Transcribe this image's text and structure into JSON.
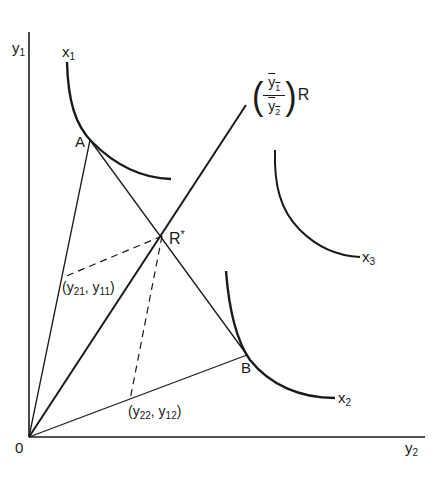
{
  "diagram": {
    "axes": {
      "y_label": "y",
      "y_sub": "1",
      "x_label": "y",
      "x_sub": "2",
      "origin_label": "0"
    },
    "curves": [
      {
        "label": "x",
        "sub": "1"
      },
      {
        "label": "x",
        "sub": "2"
      },
      {
        "label": "x",
        "sub": "3"
      }
    ],
    "points": {
      "A": "A",
      "B": "B",
      "R_star": "R",
      "R_star_sup": "*"
    },
    "ray_label": {
      "numerator": "y′1",
      "num_text": "y",
      "num_sub": "1",
      "den_text": "y",
      "den_sub": "2",
      "suffix": "R",
      "open_paren": "(",
      "close_paren": ")"
    },
    "coords": {
      "left": {
        "open": "(",
        "a": "y",
        "a_sub": "21",
        "sep": ", ",
        "b": "y",
        "b_sub": "11",
        "close": ")"
      },
      "bottom": {
        "open": "(",
        "a": "y",
        "a_sub": "22",
        "sep": ", ",
        "b": "y",
        "b_sub": "12",
        "close": ")"
      }
    }
  }
}
